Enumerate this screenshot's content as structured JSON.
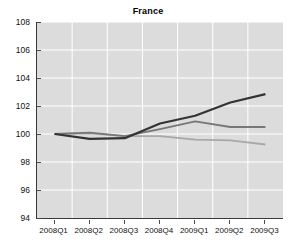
{
  "chart_data": {
    "type": "line",
    "title": "France",
    "xlabel": "",
    "ylabel": "",
    "categories": [
      "2008Q1",
      "2008Q2",
      "2008Q3",
      "2008Q4",
      "2009Q1",
      "2009Q2",
      "2009Q3"
    ],
    "ylim": [
      94,
      108
    ],
    "yticks": [
      94,
      96,
      98,
      100,
      102,
      104,
      106,
      108
    ],
    "grid": true,
    "legend": "none",
    "plot_background": "#dcdcdc",
    "gridline_color": "#ffffff",
    "axis_color": "#3a3a3a",
    "series": [
      {
        "name": "series-dark",
        "color": "#333333",
        "width": 2.2,
        "values": [
          100.0,
          99.65,
          99.7,
          100.75,
          101.3,
          102.25,
          102.85
        ]
      },
      {
        "name": "series-medium-gray",
        "color": "#777777",
        "width": 1.8,
        "values": [
          100.0,
          100.1,
          99.85,
          100.35,
          100.9,
          100.5,
          100.5
        ]
      },
      {
        "name": "series-light-gray",
        "color": "#a8a8a8",
        "width": 1.8,
        "values": [
          100.0,
          100.05,
          99.85,
          99.85,
          99.6,
          99.55,
          99.25
        ]
      }
    ]
  }
}
